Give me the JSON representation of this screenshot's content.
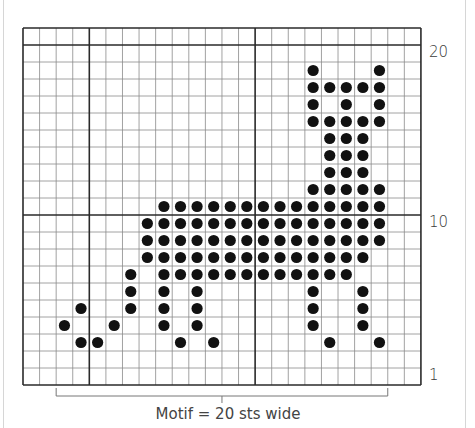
{
  "chart_title": "Knitting colorwork chart - cat motif",
  "grid": {
    "columns": 24,
    "rows": 21,
    "origin_x": 23,
    "origin_y": 28,
    "cell_w": 16.58,
    "cell_h": 17.0,
    "thick_cols": [
      0,
      4,
      14,
      24
    ],
    "thick_rows": [
      0,
      1,
      11,
      21
    ],
    "line_color": "#8a8a8a",
    "thick_color": "#2a2a2a",
    "dot_color": "#111111"
  },
  "row_labels": [
    {
      "text": "20",
      "row_from_top": 1
    },
    {
      "text": "10",
      "row_from_top": 11
    },
    {
      "text": "1",
      "row_from_top": 20
    }
  ],
  "dots": {
    "2": [
      17,
      21
    ],
    "3": [
      17,
      18,
      19,
      20,
      21
    ],
    "4": [
      17,
      19,
      21
    ],
    "5": [
      17,
      18,
      19,
      20,
      21
    ],
    "6": [
      18,
      19,
      20
    ],
    "7": [
      18,
      19,
      20
    ],
    "8": [
      18,
      19,
      20
    ],
    "9": [
      17,
      18,
      19,
      20,
      21
    ],
    "10": [
      8,
      9,
      10,
      11,
      12,
      13,
      14,
      15,
      16,
      17,
      18,
      19,
      20,
      21
    ],
    "11": [
      7,
      8,
      9,
      10,
      11,
      12,
      13,
      14,
      15,
      16,
      17,
      18,
      19,
      20,
      21
    ],
    "12": [
      7,
      8,
      9,
      10,
      11,
      12,
      13,
      14,
      15,
      16,
      17,
      18,
      19,
      20,
      21
    ],
    "13": [
      7,
      8,
      9,
      10,
      11,
      12,
      13,
      14,
      15,
      16,
      17,
      18,
      19,
      20
    ],
    "14": [
      6,
      8,
      9,
      10,
      11,
      12,
      13,
      14,
      15,
      16,
      17,
      18,
      19
    ],
    "15": [
      6,
      8,
      10,
      17,
      20
    ],
    "16": [
      3,
      6,
      8,
      10,
      17,
      20
    ],
    "17": [
      2,
      5,
      8,
      10,
      17,
      20
    ],
    "18": [
      3,
      4,
      9,
      11,
      18,
      21
    ]
  },
  "motif_bracket": {
    "start_col": 2,
    "end_col": 22,
    "y": 396
  },
  "caption": "Motif = 20 sts wide"
}
